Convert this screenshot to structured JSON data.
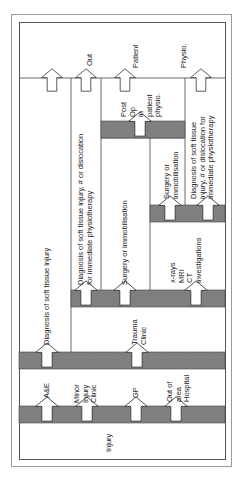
{
  "diagram": {
    "type": "patient-pathway-flowchart",
    "orientation": "rotated-90",
    "colors": {
      "band_fill": "#7d7d7d",
      "line": "#444444",
      "frame": "#9a9a9a",
      "background": "#ffffff"
    },
    "stage_0": {
      "label": "Injury"
    },
    "stage_1": {
      "entry_points": [
        {
          "id": "ae",
          "label": "A&E"
        },
        {
          "id": "minor_injury",
          "label": "Minor\nInjury\nClinic"
        },
        {
          "id": "gp",
          "label": "GP"
        },
        {
          "id": "out_of_area",
          "label": "Out of\narea\nHospital"
        }
      ]
    },
    "stage_2": {
      "boxes": [
        {
          "id": "diag_soft_tissue",
          "label": "Diagnosis of soft tissue injury"
        },
        {
          "id": "trauma_clinic",
          "label": "Trauma\nClinic"
        }
      ]
    },
    "stage_3": {
      "boxes": [
        {
          "id": "diag_immediate",
          "label": "Diagnosis of soft tissue injury, # or dislocation\nfor immediate physiotherapy"
        },
        {
          "id": "surgery_immob",
          "label": "Surgery or immobilisation"
        },
        {
          "id": "investigations",
          "label": "x-rays\nMRI\nCT\ninvestigations"
        }
      ]
    },
    "stage_4": {
      "boxes": [
        {
          "id": "surgery_immob_2",
          "label": "Surgery or\nimmobilisation"
        },
        {
          "id": "diag_immediate_2",
          "label": "Diagnosis of soft tissue\ninjury, # or dislocation for\nimmediate physiotherapy"
        }
      ]
    },
    "stage_5": {
      "boxes": [
        {
          "id": "post_op",
          "label": "Post\nOp\nin\npatient\nphysio."
        }
      ]
    },
    "outcomes": [
      {
        "id": "out",
        "label": "Out"
      },
      {
        "id": "patient",
        "label": "Patient"
      },
      {
        "id": "physio",
        "label": "Physio."
      }
    ]
  }
}
